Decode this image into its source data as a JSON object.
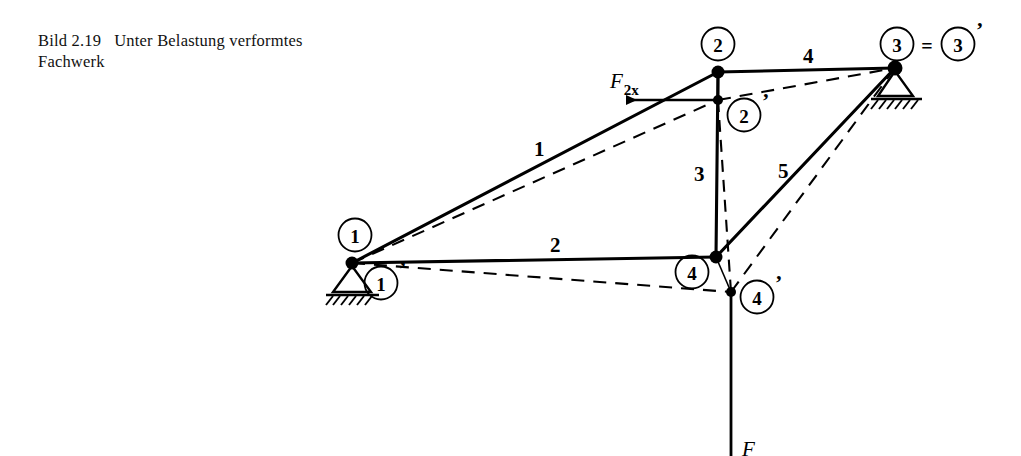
{
  "figure": {
    "caption_label": "Bild 2.19",
    "caption_text_line1": "Unter Belastung verformtes",
    "caption_text_line2": "Fachwerk"
  },
  "diagram": {
    "type": "truss-deformation",
    "colors": {
      "line": "#000000",
      "background": "#ffffff"
    },
    "nodes": [
      {
        "id": "1",
        "label": "1",
        "x": 352,
        "y": 263,
        "kind": "undeformed",
        "support": "pin"
      },
      {
        "id": "2",
        "label": "2",
        "x": 718,
        "y": 72,
        "kind": "undeformed",
        "support": "none"
      },
      {
        "id": "3",
        "label": "3",
        "x": 895,
        "y": 68,
        "kind": "undeformed",
        "support": "roller"
      },
      {
        "id": "4",
        "label": "4",
        "x": 716,
        "y": 257,
        "kind": "undeformed",
        "support": "none"
      },
      {
        "id": "1p",
        "label": "1",
        "x": 352,
        "y": 263,
        "kind": "deformed",
        "support": "pin"
      },
      {
        "id": "2p",
        "label": "2",
        "x": 718,
        "y": 100,
        "kind": "deformed",
        "support": "none"
      },
      {
        "id": "3p",
        "label": "3",
        "x": 895,
        "y": 68,
        "kind": "deformed",
        "support": "roller"
      },
      {
        "id": "4p",
        "label": "4",
        "x": 731,
        "y": 292,
        "kind": "deformed",
        "support": "none"
      }
    ],
    "node_label_markers": [
      {
        "name": "node-marker-1",
        "label": "1",
        "cx": 355,
        "cy": 235,
        "prime": false
      },
      {
        "name": "node-marker-1-prime",
        "label": "1",
        "cx": 381,
        "cy": 283,
        "prime": true
      },
      {
        "name": "node-marker-2",
        "label": "2",
        "cx": 718,
        "cy": 44,
        "prime": false
      },
      {
        "name": "node-marker-2-prime",
        "label": "2",
        "cx": 744,
        "cy": 115,
        "prime": true
      },
      {
        "name": "node-marker-3",
        "label": "3",
        "cx": 897,
        "cy": 44,
        "prime": false
      },
      {
        "name": "node-marker-3-prime",
        "label": "3",
        "cx": 958,
        "cy": 44,
        "prime": true
      },
      {
        "name": "node-marker-4",
        "label": "4",
        "cx": 692,
        "cy": 272,
        "prime": false
      },
      {
        "name": "node-marker-4-prime",
        "label": "4",
        "cx": 757,
        "cy": 297,
        "prime": true
      }
    ],
    "equals_sign": {
      "text": "=",
      "x": 927,
      "y": 51
    },
    "members": [
      {
        "id": "1",
        "label": "1",
        "from": "1",
        "to": "2",
        "label_x": 540,
        "label_y": 152
      },
      {
        "id": "2",
        "label": "2",
        "from": "1",
        "to": "4",
        "label_x": 556,
        "label_y": 249
      },
      {
        "id": "3",
        "label": "3",
        "from": "2",
        "to": "4",
        "label_x": 700,
        "label_y": 177
      },
      {
        "id": "4",
        "label": "4",
        "from": "2",
        "to": "3",
        "label_x": 809,
        "label_y": 61
      },
      {
        "id": "5",
        "label": "5",
        "from": "4",
        "to": "3",
        "label_x": 783,
        "label_y": 175
      }
    ],
    "deformed_members": [
      {
        "id": "1p",
        "from": "1p",
        "to": "2p"
      },
      {
        "id": "2p",
        "from": "1p",
        "to": "4p"
      },
      {
        "id": "3p",
        "from": "2p",
        "to": "4p"
      },
      {
        "id": "4p",
        "from": "2p",
        "to": "3p"
      },
      {
        "id": "5p",
        "from": "4p",
        "to": "3p"
      }
    ],
    "forces": [
      {
        "name": "force-F2x",
        "symbol": "F",
        "subscript": "2x",
        "applied_at": "2p",
        "direction": "left",
        "label_x": 613,
        "label_y": 87,
        "arrow_from_x": 718,
        "arrow_from_y": 100,
        "arrow_to_x": 618,
        "arrow_to_y": 100
      },
      {
        "name": "force-F",
        "symbol": "F",
        "subscript": "",
        "applied_at": "4p",
        "direction": "down",
        "label_x": 745,
        "label_y": 452,
        "arrow_from_x": 731,
        "arrow_from_y": 292,
        "arrow_to_x": 731,
        "arrow_to_y": 456
      }
    ],
    "supports": [
      {
        "name": "support-node-1",
        "type": "pin",
        "x": 352,
        "y": 263,
        "rotation": 0
      },
      {
        "name": "support-node-3",
        "type": "roller",
        "x": 895,
        "y": 68,
        "rotation": 0
      }
    ]
  }
}
